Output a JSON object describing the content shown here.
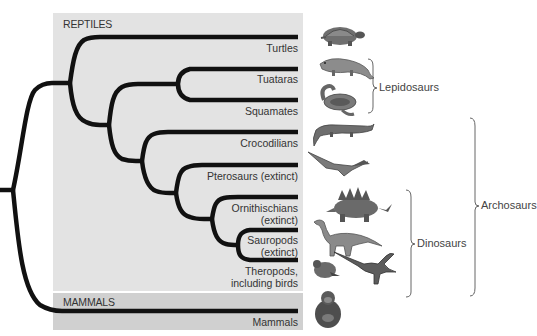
{
  "panels": {
    "reptiles": "REPTILES",
    "mammals": "MAMMALS"
  },
  "taxa": [
    {
      "name": "Turtles",
      "y": 37,
      "label_lines": [
        "Turtles"
      ],
      "icon": "turtle-icon"
    },
    {
      "name": "Tuataras",
      "y": 69,
      "label_lines": [
        "Tuataras"
      ],
      "icon": "tuatara-icon"
    },
    {
      "name": "Squamates",
      "y": 100,
      "label_lines": [
        "Squamates"
      ],
      "icon": "snake-icon"
    },
    {
      "name": "Crocodilians",
      "y": 132,
      "label_lines": [
        "Crocodilians"
      ],
      "icon": "crocodile-icon"
    },
    {
      "name": "Pterosaurs",
      "y": 165,
      "label_lines": [
        "Pterosaurs (extinct)"
      ],
      "icon": "pterosaur-icon"
    },
    {
      "name": "Ornithischians",
      "y": 197,
      "label_lines": [
        "Ornithischians",
        "(extinct)"
      ],
      "icon": "stegosaurus-icon"
    },
    {
      "name": "Sauropods",
      "y": 230,
      "label_lines": [
        "Sauropods",
        "(extinct)"
      ],
      "icon": "sauropod-icon"
    },
    {
      "name": "Theropods",
      "y": 260,
      "label_lines": [
        "Theropods,",
        "including birds"
      ],
      "icon": "theropod-bird-icon"
    },
    {
      "name": "Mammals",
      "y": 311,
      "label_lines": [
        "Mammals"
      ],
      "icon": "chimpanzee-icon"
    }
  ],
  "labels": {
    "turtles": "Turtles",
    "tuataras": "Tuataras",
    "squamates": "Squamates",
    "crocodilians": "Crocodilians",
    "pterosaurs": "Pterosaurs (extinct)",
    "ornithischians_1": "Ornithischians",
    "ornithischians_2": "(extinct)",
    "sauropods_1": "Sauropods",
    "sauropods_2": "(extinct)",
    "theropods_1": "Theropods,",
    "theropods_2": "including birds",
    "mammals": "Mammals"
  },
  "groups": {
    "lepidosaurs": "Lepidosaurs",
    "archosaurs": "Archosaurs",
    "dinosaurs": "Dinosaurs"
  },
  "colors": {
    "branch": "#111111",
    "reptile_panel": "#e3e3e3",
    "mammal_panel": "#d0d0d0",
    "text": "#333333",
    "bracket": "#555555"
  }
}
